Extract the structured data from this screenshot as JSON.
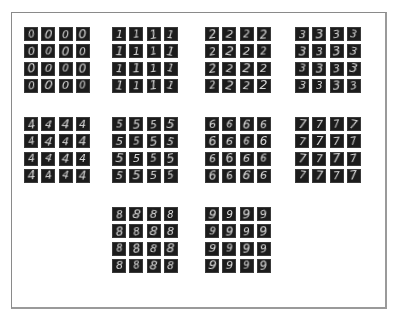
{
  "figure": {
    "colors": {
      "background": "#ffffff",
      "frame_border": "#8a8a8a",
      "cell_background": "#1c1c1c",
      "digit_stroke": "#e6e6e6"
    },
    "grids": [
      {
        "label": "0",
        "x": 24,
        "y": 27,
        "cells": [
          "0",
          "0",
          "0",
          "0",
          "0",
          "0",
          "0",
          "0",
          "0",
          "0",
          "0",
          "0",
          "0",
          "0",
          "0",
          "0"
        ]
      },
      {
        "label": "1",
        "x": 112,
        "y": 27,
        "cells": [
          "1",
          "1",
          "1",
          "1",
          "1",
          "1",
          "1",
          "1",
          "1",
          "1",
          "1",
          "1",
          "1",
          "1",
          "1",
          "1"
        ]
      },
      {
        "label": "2",
        "x": 205,
        "y": 27,
        "cells": [
          "2",
          "2",
          "2",
          "2",
          "2",
          "2",
          "2",
          "2",
          "2",
          "2",
          "2",
          "2",
          "2",
          "2",
          "2",
          "2"
        ]
      },
      {
        "label": "3",
        "x": 295,
        "y": 27,
        "cells": [
          "3",
          "3",
          "3",
          "3",
          "3",
          "3",
          "3",
          "3",
          "3",
          "3",
          "3",
          "3",
          "3",
          "3",
          "3",
          "3"
        ]
      },
      {
        "label": "4",
        "x": 24,
        "y": 117,
        "cells": [
          "4",
          "4",
          "4",
          "4",
          "4",
          "4",
          "4",
          "4",
          "4",
          "4",
          "4",
          "4",
          "4",
          "4",
          "4",
          "4"
        ]
      },
      {
        "label": "5",
        "x": 112,
        "y": 117,
        "cells": [
          "5",
          "5",
          "5",
          "5",
          "5",
          "5",
          "5",
          "5",
          "5",
          "5",
          "5",
          "5",
          "5",
          "5",
          "5",
          "5"
        ]
      },
      {
        "label": "6",
        "x": 205,
        "y": 117,
        "cells": [
          "6",
          "6",
          "6",
          "6",
          "6",
          "6",
          "6",
          "6",
          "6",
          "6",
          "6",
          "6",
          "6",
          "6",
          "6",
          "6"
        ]
      },
      {
        "label": "7",
        "x": 295,
        "y": 117,
        "cells": [
          "7",
          "7",
          "7",
          "7",
          "7",
          "7",
          "7",
          "7",
          "7",
          "7",
          "7",
          "7",
          "7",
          "7",
          "7",
          "7"
        ]
      },
      {
        "label": "8",
        "x": 112,
        "y": 207,
        "cells": [
          "8",
          "8",
          "8",
          "8",
          "8",
          "8",
          "8",
          "8",
          "8",
          "8",
          "8",
          "8",
          "8",
          "8",
          "8",
          "8"
        ]
      },
      {
        "label": "9",
        "x": 205,
        "y": 207,
        "cells": [
          "9",
          "9",
          "9",
          "9",
          "9",
          "9",
          "9",
          "9",
          "9",
          "9",
          "9",
          "9",
          "9",
          "9",
          "9",
          "9"
        ]
      }
    ]
  }
}
